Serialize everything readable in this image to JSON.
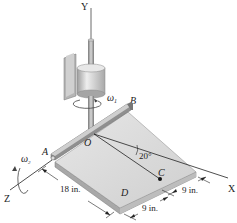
{
  "diagram": {
    "axes": {
      "y": "Y",
      "x": "X",
      "z": "Z"
    },
    "points": {
      "a": "A",
      "b": "B",
      "o": "O",
      "c": "C",
      "d": "D"
    },
    "angular_velocities": {
      "w1": "ω",
      "w1_sub": "1",
      "w2": "ω",
      "w2_sub": "2"
    },
    "angle": "20°",
    "dimensions": {
      "length_ad": "18 in.",
      "c_to_corner": "9 in.",
      "d_to_c": "9 in."
    },
    "colors": {
      "plate_top": "#dcdcdc",
      "plate_side": "#a9a9a9",
      "shaft": "#9a9a9a",
      "housing": "#c8c8c8"
    }
  }
}
